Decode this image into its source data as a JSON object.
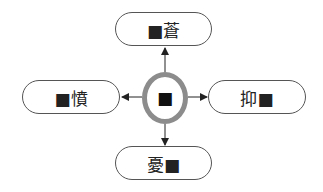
{
  "diagram": {
    "center": {
      "label": "■"
    },
    "nodes": [
      {
        "id": "top",
        "label": "■蒼"
      },
      {
        "id": "left",
        "label": "■憤"
      },
      {
        "id": "right",
        "label": "抑■"
      },
      {
        "id": "bottom",
        "label": "憂■"
      }
    ],
    "colors": {
      "ring": "#8c8c8c",
      "stroke": "#555555",
      "arrow": "#222222"
    }
  }
}
